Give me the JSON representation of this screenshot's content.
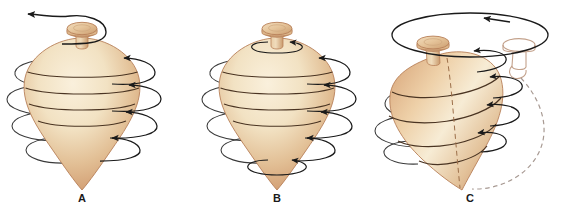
{
  "figure": {
    "background_color": "#ffffff",
    "width": 567,
    "height": 215
  },
  "colors": {
    "body_highlight": "#f6e8cd",
    "body_mid": "#eccfa6",
    "body_shadow": "#d39f74",
    "body_deep_shadow": "#c08a5e",
    "body_outline": "#b07a4e",
    "knob_highlight": "#f0dcbc",
    "knob_mid": "#e0bd93",
    "knob_shadow": "#c99a6c",
    "arrow_stroke": "#1a1a1a",
    "ghost_stroke": "#b08f7a",
    "dashed_stroke": "#a89a93",
    "label_color": "#1a1a1a"
  },
  "panels": [
    {
      "id": "panel-a",
      "label": "A",
      "label_x": 82,
      "label_y": 202,
      "caption_meaning": "spin with handle sweep arrow",
      "arrows": {
        "top_sweep": {
          "name": "spiral-sweep-arrow",
          "direction": "leftward",
          "arrowhead": "left"
        },
        "spin_loops_count": 4,
        "spin_loop_direction": "up-right"
      }
    },
    {
      "id": "panel-b",
      "label": "B",
      "label_x": 277,
      "label_y": 202,
      "caption_meaning": "pure spin about vertical axis",
      "arrows": {
        "top_stem_loop": {
          "name": "stem-spin-arrow",
          "arrowhead": "right"
        },
        "tip_loop": {
          "name": "tip-spin-arrow",
          "arrowhead": "right"
        },
        "spin_loops_count": 4,
        "spin_loop_direction": "up-right"
      }
    },
    {
      "id": "panel-c",
      "label": "C",
      "label_x": 470,
      "label_y": 202,
      "caption_meaning": "precession: axis sweeps a cone, ghost position shown dashed",
      "arrows": {
        "precession_ellipse": {
          "name": "precession-path-arrow",
          "direction": "leftward",
          "arrowhead": "left"
        },
        "spin_loops_count": 3,
        "spin_loop_direction": "right"
      },
      "ghost": {
        "name": "ghost-top-outline",
        "style": "outline only",
        "dashed_path": true
      }
    }
  ]
}
